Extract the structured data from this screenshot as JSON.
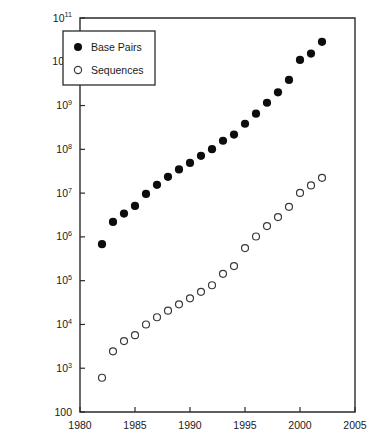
{
  "chart_data": {
    "type": "scatter",
    "title": "",
    "subtitle": "",
    "xlabel": "",
    "ylabel": "",
    "xlim": [
      1980,
      2005
    ],
    "ylim": [
      100,
      100000000000.0
    ],
    "yscale": "log",
    "xscale": "linear",
    "grid": false,
    "legend_position": "top-left",
    "x_ticks": [
      1980,
      1985,
      1990,
      1995,
      2000,
      2005
    ],
    "x_tick_labels": [
      "1980",
      "1985",
      "1990",
      "1995",
      "2000",
      "2005"
    ],
    "y_ticks": [
      100,
      1000,
      10000,
      100000,
      1000000,
      10000000,
      100000000,
      1000000000,
      10000000000,
      100000000000
    ],
    "y_tick_labels": [
      {
        "mantissa": "100",
        "exponent": ""
      },
      {
        "mantissa": "10",
        "exponent": "3"
      },
      {
        "mantissa": "10",
        "exponent": "4"
      },
      {
        "mantissa": "10",
        "exponent": "5"
      },
      {
        "mantissa": "10",
        "exponent": "6"
      },
      {
        "mantissa": "10",
        "exponent": "7"
      },
      {
        "mantissa": "10",
        "exponent": "8"
      },
      {
        "mantissa": "10",
        "exponent": "9"
      },
      {
        "mantissa": "10",
        "exponent": "10"
      },
      {
        "mantissa": "10",
        "exponent": "11"
      }
    ],
    "x": [
      1982,
      1983,
      1984,
      1985,
      1986,
      1987,
      1988,
      1989,
      1990,
      1991,
      1992,
      1993,
      1994,
      1995,
      1996,
      1997,
      1998,
      1999,
      2000,
      2001,
      2002
    ],
    "series": [
      {
        "name": "Base Pairs",
        "marker": "filled-circle",
        "color": "#0d0d0d",
        "values": [
          680000,
          2200000,
          3400000,
          5100000,
          9600000,
          15500000,
          23500000,
          34800000,
          49000000,
          71000000,
          101000000,
          157000000,
          217000000,
          384000000,
          651000000,
          1160000000,
          2010000000,
          3840000000,
          11000000000,
          15400000000,
          28500000000
        ]
      },
      {
        "name": "Sequences",
        "marker": "open-circle",
        "color": "#ffffff",
        "values": [
          606,
          2427,
          4175,
          5700,
          9978,
          14584,
          20579,
          28791,
          39533,
          55627,
          78608,
          143492,
          215273,
          555694,
          1021211,
          1765847,
          2837897,
          4864570,
          10106023,
          14976310,
          22318883
        ]
      }
    ],
    "legend": [
      {
        "label": "Base Pairs",
        "marker": "filled-circle"
      },
      {
        "label": "Sequences",
        "marker": "open-circle"
      }
    ]
  }
}
